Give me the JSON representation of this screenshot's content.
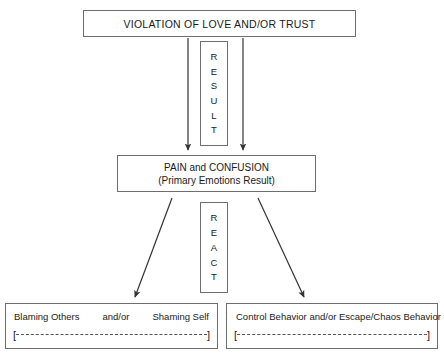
{
  "diagram": {
    "title_text": "VIOLATION OF LOVE AND/OR TRUST",
    "nodes": {
      "violation": {
        "label": "VIOLATION OF LOVE AND/OR TRUST"
      },
      "pain": {
        "line1": "PAIN and CONFUSION",
        "line2": "(Primary Emotions Result)"
      },
      "result_stack": {
        "word": "RESULT",
        "letters": [
          "R",
          "E",
          "S",
          "U",
          "L",
          "T"
        ]
      },
      "react_stack": {
        "word": "REACT",
        "letters": [
          "R",
          "E",
          "A",
          "C",
          "T"
        ]
      },
      "blaming": {
        "left_text": "Blaming Others",
        "middle_text": "and/or",
        "right_text": "Shaming Self",
        "full_text": "Blaming Others and/or Shaming Self",
        "rule_open": "[",
        "rule_close": "]"
      },
      "control": {
        "text": "Control Behavior and/or Escape/Chaos Behavior",
        "rule_open": "[",
        "rule_close": "]"
      }
    },
    "colors": {
      "border": "#6e6e6e",
      "arrow": "#333333",
      "background": "#ffffff",
      "text": "#1a1a1a"
    }
  }
}
